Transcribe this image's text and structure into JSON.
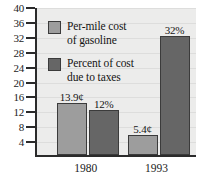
{
  "chart_data": {
    "type": "bar",
    "title": "",
    "xlabel": "",
    "ylabel": "",
    "categories": [
      "1980",
      "1993"
    ],
    "ylim": [
      0,
      40
    ],
    "y_ticks": [
      4,
      8,
      12,
      16,
      20,
      24,
      28,
      32,
      36,
      40
    ],
    "grid": true,
    "legend_position": "inside-top-left",
    "series": [
      {
        "name": "Per-mile cost of gasoline",
        "color": "#9d9d9d",
        "values": [
          13.9,
          5.4
        ],
        "data_labels": [
          "13.9¢",
          "5.4¢"
        ]
      },
      {
        "name": "Percent of cost due to taxes",
        "color": "#666666",
        "values": [
          12,
          32
        ],
        "data_labels": [
          "12%",
          "32%"
        ]
      }
    ]
  },
  "axis": {
    "y_tick_labels": [
      "40",
      "36",
      "32",
      "28",
      "24",
      "20",
      "16",
      "12",
      "8",
      "4"
    ],
    "x_tick_labels": [
      "1980",
      "1993"
    ]
  },
  "legend": {
    "items": [
      {
        "label": "Per-mile cost\nof gasoline",
        "swatch": "light"
      },
      {
        "label": "Percent of cost\ndue to taxes",
        "swatch": "dark"
      }
    ]
  },
  "colors": {
    "series_light": "#9d9d9d",
    "series_dark": "#666666",
    "plot_background": "#ececeb",
    "axis": "#2b2b2b",
    "text": "#151515"
  }
}
